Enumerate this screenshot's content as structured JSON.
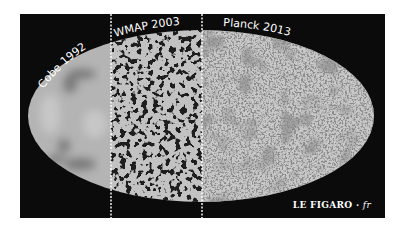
{
  "figure": {
    "sections": [
      {
        "label": "Cobe 1992",
        "style": "smooth-blurry"
      },
      {
        "label": "WMAP 2003",
        "style": "medium-resolution"
      },
      {
        "label": "Planck 2013",
        "style": "high-resolution"
      }
    ],
    "brand": {
      "name": "LE FIGARO",
      "separator": "·",
      "suffix": "fr"
    },
    "colors": {
      "background": "#0b0b0b",
      "map_base": "#bdbdbd",
      "divider": "#ffffff",
      "text": "#ffffff"
    }
  }
}
